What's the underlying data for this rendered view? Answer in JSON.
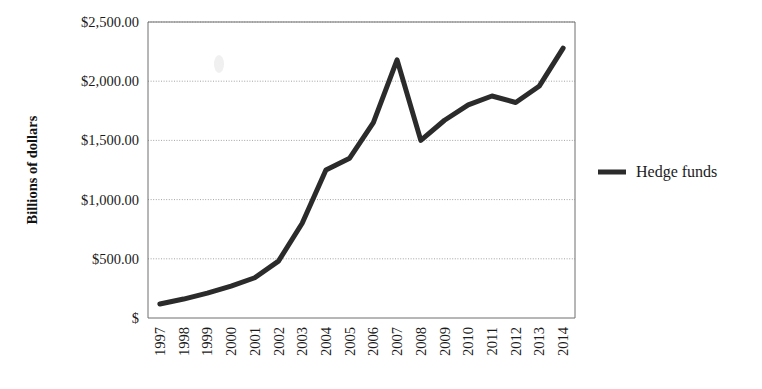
{
  "chart_data": {
    "type": "line",
    "title": "",
    "xlabel": "",
    "ylabel": "Billions of dollars",
    "categories": [
      "1997",
      "1998",
      "1999",
      "2000",
      "2001",
      "2002",
      "2003",
      "2004",
      "2005",
      "2006",
      "2007",
      "2008",
      "2009",
      "2010",
      "2011",
      "2012",
      "2013",
      "2014"
    ],
    "series": [
      {
        "name": "Hedge funds",
        "color": "#2b2b2b",
        "values": [
          118,
          160,
          210,
          270,
          340,
          480,
          800,
          1250,
          1350,
          1650,
          2180,
          1500,
          1670,
          1800,
          1875,
          1820,
          1960,
          2280
        ]
      }
    ],
    "ylim": [
      0,
      2500
    ],
    "ytick_values": [
      0,
      500,
      1000,
      1500,
      2000,
      2500
    ],
    "ytick_labels": [
      "$",
      "$500.00",
      "$1,000.00",
      "$1,500.00",
      "$2,000.00",
      "$2,500.00"
    ],
    "grid": true,
    "legend_position": "right",
    "xtick_rotation": -90,
    "currency_prefix": "$"
  },
  "legend": {
    "entries": [
      {
        "label": "Hedge funds",
        "color": "#2b2b2b"
      }
    ]
  },
  "axes": {
    "y_title": "Billions of dollars"
  }
}
